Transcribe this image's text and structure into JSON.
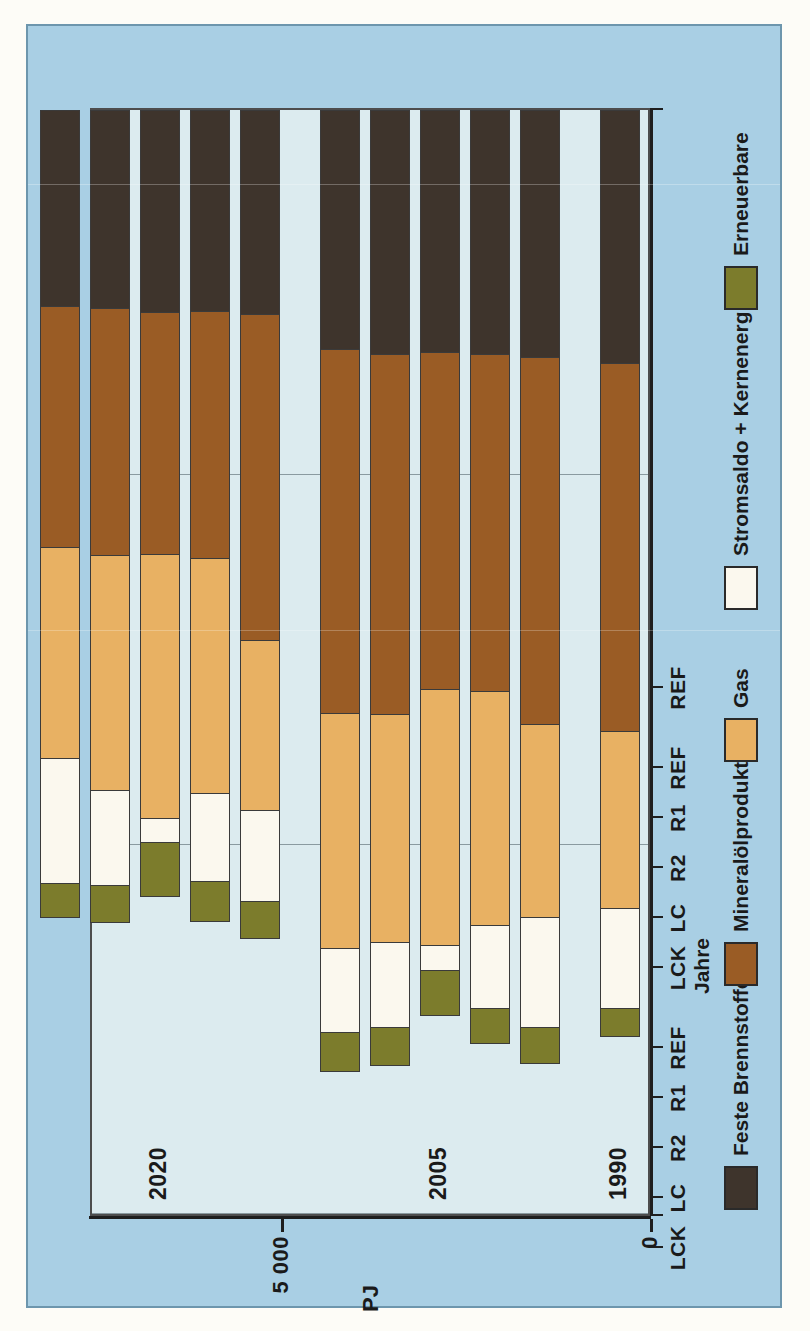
{
  "figure": {
    "background_color": "#a9cfe4",
    "plot_background_color": "#dcebef"
  },
  "axes": {
    "value_unit": "PJ",
    "value_ticks": [
      "15 000",
      "10 000",
      "5 000",
      "0"
    ],
    "category_title": "Jahre"
  },
  "groups": [
    {
      "year": "1990"
    },
    {
      "year": "2005"
    },
    {
      "year": "2020"
    }
  ],
  "legend": [
    {
      "label": "Feste Brennstoffe",
      "color": "#3e342c"
    },
    {
      "label": "Mineralölprodukte",
      "color": "#9a5c25"
    },
    {
      "label": "Gas",
      "color": "#e8b163"
    },
    {
      "label": "Stromsaldo + Kernenergie",
      "color": "#fbf8ee"
    },
    {
      "label": "Erneuerbare",
      "color": "#7c7c2c"
    }
  ],
  "chart_data": {
    "type": "bar",
    "orientation": "horizontal-stacked",
    "title": "",
    "xlabel": "Jahre",
    "ylabel": "PJ",
    "ylim": [
      0,
      15000
    ],
    "yticks": [
      0,
      5000,
      10000,
      15000
    ],
    "grid": true,
    "legend_position": "bottom",
    "categories": [
      "REF",
      "REF",
      "R1",
      "R2",
      "LC",
      "LCK",
      "REF",
      "R1",
      "R2",
      "LC",
      "LCK"
    ],
    "group_of_category": [
      "1990",
      "2005",
      "2005",
      "2005",
      "2005",
      "2005",
      "2020",
      "2020",
      "2020",
      "2020",
      "2020"
    ],
    "series": [
      {
        "name": "Feste Brennstoffe",
        "color": "#3e342c",
        "values": [
          3430,
          3350,
          3300,
          3280,
          3300,
          3230,
          2760,
          2720,
          2730,
          2680,
          2650
        ]
      },
      {
        "name": "Mineralölprodukte",
        "color": "#9a5c25",
        "values": [
          4980,
          4960,
          4560,
          4560,
          4880,
          4930,
          4420,
          3340,
          3280,
          3350,
          3260
        ]
      },
      {
        "name": "Gas",
        "color": "#e8b163",
        "values": [
          2400,
          2610,
          3180,
          3460,
          3090,
          3190,
          2300,
          3190,
          3570,
          3180,
          2860
        ]
      },
      {
        "name": "Stromsaldo + Kernenergie",
        "color": "#fbf8ee",
        "values": [
          1350,
          1490,
          1120,
          340,
          1150,
          1130,
          1230,
          1190,
          330,
          1280,
          1700
        ]
      },
      {
        "name": "Erneuerbare",
        "color": "#7c7c2c",
        "values": [
          390,
          500,
          480,
          620,
          520,
          550,
          520,
          560,
          740,
          520,
          470
        ]
      }
    ],
    "totals": [
      12550,
      12910,
      12640,
      12260,
      12940,
      13030,
      11230,
      11000,
      10650,
      11010,
      10940
    ]
  }
}
